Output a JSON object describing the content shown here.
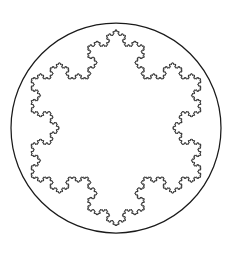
{
  "figure": {
    "background_color": "#ffffff",
    "stroke_color": "#1a1a1a",
    "canvas": {
      "width": 232,
      "height": 253
    }
  },
  "chart_data": {
    "type": "line",
    "subtitle": "",
    "xlabel": "",
    "ylabel": "",
    "grid": false,
    "legend": "none",
    "xlim": [
      0,
      232
    ],
    "ylim": [
      0,
      253
    ],
    "shapes": [
      {
        "name": "bounding-circle",
        "type": "circle",
        "center_x": 116,
        "center_y": 128,
        "radius": 105,
        "stroke": "#1a1a1a",
        "stroke_width": 1.25,
        "fill": "none"
      },
      {
        "name": "koch-snowflake",
        "type": "koch-snowflake",
        "center_x": 116,
        "center_y": 128,
        "circumradius": 98,
        "iterations": 5,
        "sides": 3,
        "orientation_deg": -90,
        "point_count": 6,
        "stroke": "#1a1a1a",
        "stroke_width": 1,
        "fill": "none"
      }
    ]
  }
}
